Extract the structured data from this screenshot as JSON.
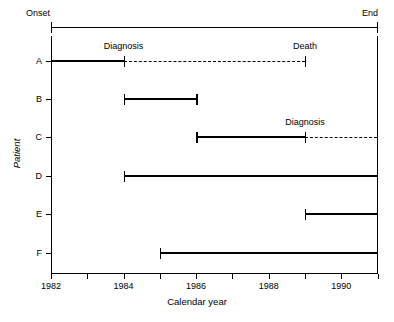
{
  "chart_data": {
    "type": "line",
    "title": "",
    "xlabel": "Calendar year",
    "ylabel": "Patient",
    "xlim": [
      1982,
      1991
    ],
    "grid": false,
    "legend": "none",
    "timeline": {
      "start_label": "Onset",
      "end_label": "End",
      "start": 1982,
      "end": 1991
    },
    "x_ticks": [
      1982,
      1983,
      1984,
      1985,
      1986,
      1987,
      1988,
      1989,
      1990,
      1991
    ],
    "x_tick_labels": [
      "1982",
      "",
      "1984",
      "",
      "1986",
      "",
      "1988",
      "",
      "1990",
      ""
    ],
    "categories": [
      "A",
      "B",
      "C",
      "D",
      "E",
      "F"
    ],
    "series": [
      {
        "name": "A",
        "observed_start": 1982,
        "observed_end": 1984,
        "censored_end": 1989,
        "start_cap": false,
        "end_cap": true,
        "dashed_after": true,
        "annotations": [
          {
            "text": "Diagnosis",
            "at": 1984
          },
          {
            "text": "Death",
            "at": 1989
          }
        ]
      },
      {
        "name": "B",
        "observed_start": 1984,
        "observed_end": 1986,
        "censored_end": null,
        "start_cap": true,
        "end_cap": true,
        "dashed_after": false,
        "annotations": []
      },
      {
        "name": "C",
        "observed_start": 1986,
        "observed_end": 1989,
        "censored_end": 1991,
        "start_cap": true,
        "end_cap": true,
        "dashed_after": true,
        "annotations": [
          {
            "text": "Diagnosis",
            "at": 1989
          }
        ]
      },
      {
        "name": "D",
        "observed_start": 1984,
        "observed_end": 1991,
        "censored_end": null,
        "start_cap": true,
        "end_cap": false,
        "dashed_after": false,
        "annotations": []
      },
      {
        "name": "E",
        "observed_start": 1989,
        "observed_end": 1991,
        "censored_end": null,
        "start_cap": true,
        "end_cap": false,
        "dashed_after": false,
        "annotations": []
      },
      {
        "name": "F",
        "observed_start": 1985,
        "observed_end": 1991,
        "censored_end": null,
        "start_cap": true,
        "end_cap": false,
        "dashed_after": false,
        "annotations": []
      }
    ],
    "colors": {
      "line": "#000000",
      "background": "#ffffff"
    }
  }
}
